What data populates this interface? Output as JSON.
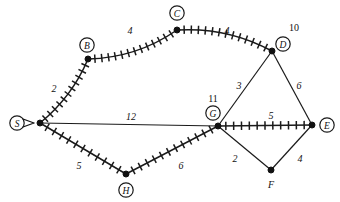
{
  "diagram": {
    "type": "weighted-undirected-graph",
    "canvas": {
      "width": 340,
      "height": 202,
      "background": "#ffffff"
    },
    "ink_color": "#111111",
    "nodes": [
      {
        "id": "S",
        "label": "S",
        "x": 40,
        "y": 123,
        "circled": true,
        "label_x": 17,
        "label_y": 123,
        "marker": "arrow"
      },
      {
        "id": "B",
        "label": "B",
        "x": 88,
        "y": 59,
        "circled": true,
        "label_x": 87,
        "label_y": 45
      },
      {
        "id": "C",
        "label": "C",
        "x": 177,
        "y": 30,
        "circled": true,
        "label_x": 177,
        "label_y": 13
      },
      {
        "id": "D",
        "label": "D",
        "x": 272,
        "y": 51,
        "circled": true,
        "label_x": 283,
        "label_y": 44
      },
      {
        "id": "E",
        "label": "E",
        "x": 312,
        "y": 125,
        "circled": true,
        "label_x": 327,
        "label_y": 125
      },
      {
        "id": "F",
        "label": "F",
        "x": 271,
        "y": 170,
        "circled": false,
        "label_x": 271,
        "label_y": 184
      },
      {
        "id": "G",
        "label": "G",
        "x": 218,
        "y": 126,
        "circled": true,
        "label_x": 213,
        "label_y": 113
      },
      {
        "id": "H",
        "label": "H",
        "x": 126,
        "y": 174,
        "circled": true,
        "label_x": 126,
        "label_y": 190
      }
    ],
    "edges": [
      {
        "id": "S-B",
        "from": "S",
        "to": "B",
        "weight": "2",
        "hatched": true,
        "label_x": 54,
        "label_y": 88,
        "curve": 5
      },
      {
        "id": "B-C",
        "from": "B",
        "to": "C",
        "weight": "4",
        "hatched": true,
        "label_x": 130,
        "label_y": 30,
        "curve": 7
      },
      {
        "id": "C-D",
        "from": "C",
        "to": "D",
        "weight": "4",
        "hatched": true,
        "label_x": 227,
        "label_y": 30,
        "curve": -7
      },
      {
        "id": "S-G",
        "from": "S",
        "to": "G",
        "weight": "12",
        "hatched": false,
        "label_x": 131,
        "label_y": 116,
        "curve": 0
      },
      {
        "id": "S-H",
        "from": "S",
        "to": "H",
        "weight": "5",
        "hatched": true,
        "label_x": 79,
        "label_y": 165,
        "curve": 0
      },
      {
        "id": "H-G",
        "from": "H",
        "to": "G",
        "weight": "6",
        "hatched": true,
        "label_x": 181,
        "label_y": 165,
        "curve": 0
      },
      {
        "id": "G-D",
        "from": "G",
        "to": "D",
        "weight": "3",
        "hatched": false,
        "label_x": 239,
        "label_y": 85,
        "curve": 0
      },
      {
        "id": "D-E",
        "from": "D",
        "to": "E",
        "weight": "6",
        "hatched": false,
        "label_x": 299,
        "label_y": 85,
        "curve": 0
      },
      {
        "id": "G-E",
        "from": "G",
        "to": "E",
        "weight": "5",
        "hatched": true,
        "label_x": 271,
        "label_y": 115,
        "curve": 0
      },
      {
        "id": "G-F",
        "from": "G",
        "to": "F",
        "weight": "2",
        "hatched": false,
        "label_x": 235,
        "label_y": 158,
        "curve": 0
      },
      {
        "id": "F-E",
        "from": "F",
        "to": "E",
        "weight": "4",
        "hatched": false,
        "label_x": 300,
        "label_y": 158,
        "curve": 0
      }
    ],
    "annotations": [
      {
        "id": "annot-d",
        "text": "10",
        "x": 294,
        "y": 27,
        "near_node": "D"
      },
      {
        "id": "annot-g",
        "text": "11",
        "x": 213,
        "y": 98,
        "near_node": "G"
      }
    ]
  }
}
